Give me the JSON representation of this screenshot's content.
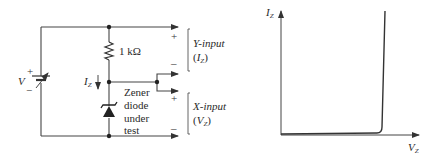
{
  "circuit": {
    "source": {
      "label": "V",
      "plus": "+",
      "minus": "−"
    },
    "resistor": {
      "label": "1 kΩ"
    },
    "current": {
      "symbol": "I",
      "subscript": "Z"
    },
    "diode": {
      "label_lines": [
        "Zener",
        "diode",
        "under",
        "test"
      ]
    },
    "y_input": {
      "name": "Y-input",
      "var": "I",
      "subscript": "Z",
      "plus": "+",
      "minus": "–"
    },
    "x_input": {
      "name": "X-input",
      "var": "V",
      "subscript": "Z",
      "plus": "+",
      "minus": "–"
    }
  },
  "graph": {
    "y_axis": {
      "symbol": "I",
      "subscript": "Z"
    },
    "x_axis": {
      "symbol": "V",
      "subscript": "Z"
    },
    "curve": "zener-characteristic-knee"
  }
}
